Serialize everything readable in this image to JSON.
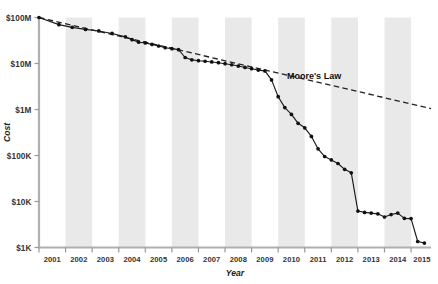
{
  "chart_data": {
    "type": "line",
    "title": "",
    "xlabel": "Year",
    "ylabel": "Cost",
    "yscale": "log",
    "ylim": [
      1000,
      100000000
    ],
    "xlim": [
      2001.0,
      2015.75
    ],
    "grid": false,
    "legend_position": "inline-annotation",
    "ytick_labels": [
      "$100M",
      "$10M",
      "$1M",
      "$100K",
      "$10K",
      "$1K"
    ],
    "ytick_values": [
      100000000,
      10000000,
      1000000,
      100000,
      10000,
      1000
    ],
    "xtick_labels": [
      "2001",
      "2002",
      "2003",
      "2004",
      "2005",
      "2006",
      "2007",
      "2008",
      "2009",
      "2010",
      "2011",
      "2012",
      "2013",
      "2014",
      "2015"
    ],
    "xtick_values": [
      2001,
      2002,
      2003,
      2004,
      2005,
      2006,
      2007,
      2008,
      2009,
      2010,
      2011,
      2012,
      2013,
      2014,
      2015
    ],
    "shaded_band_years": [
      2002,
      2004,
      2006,
      2008,
      2010,
      2012,
      2014
    ],
    "annotations": [
      {
        "text": "Moore's Law",
        "x": 2011.35,
        "y": 4600000
      }
    ],
    "series": [
      {
        "name": "Cost per Genome",
        "marker": "circle",
        "x": [
          2001.0,
          2001.75,
          2002.25,
          2002.75,
          2003.25,
          2003.75,
          2004.25,
          2004.5,
          2004.75,
          2005.0,
          2005.25,
          2005.5,
          2005.75,
          2006.0,
          2006.25,
          2006.5,
          2006.75,
          2007.0,
          2007.25,
          2007.5,
          2007.75,
          2008.0,
          2008.25,
          2008.5,
          2008.75,
          2009.0,
          2009.25,
          2009.5,
          2009.75,
          2010.0,
          2010.25,
          2010.5,
          2010.75,
          2011.0,
          2011.25,
          2011.5,
          2011.75,
          2012.0,
          2012.25,
          2012.5,
          2012.75,
          2013.0,
          2013.25,
          2013.5,
          2013.75,
          2014.0,
          2014.25,
          2014.5,
          2014.75,
          2015.0,
          2015.25,
          2015.5
        ],
        "y": [
          100000000,
          70000000,
          61000000,
          55000000,
          51000000,
          45000000,
          38000000,
          33000000,
          29000000,
          28000000,
          26000000,
          24000000,
          22000000,
          21000000,
          20000000,
          13500000,
          12000000,
          11500000,
          11200000,
          10800000,
          10400000,
          9900000,
          9400000,
          8800000,
          8200000,
          7700000,
          7200000,
          6900000,
          4400000,
          1900000,
          1100000,
          780000,
          500000,
          400000,
          260000,
          140000,
          95000,
          80000,
          67000,
          50000,
          42000,
          33000,
          29000,
          22000,
          16000,
          13000,
          9800,
          8600,
          8200,
          7800,
          7700,
          7500
        ],
        "y_tail_x": [
          2013.0,
          2013.25,
          2013.5,
          2013.75,
          2014.0,
          2014.25,
          2014.5,
          2014.75,
          2015.0,
          2015.25,
          2015.5
        ],
        "y_tail": [
          6200,
          5800,
          5600,
          5400,
          4600,
          5200,
          5600,
          4300,
          4250,
          1350,
          1250
        ]
      }
    ],
    "reference_line": {
      "name": "Moore's Law",
      "x": [
        2001.0,
        2015.75
      ],
      "y": [
        100000000,
        1050000
      ],
      "style": "dashed"
    }
  },
  "axis_titles": {
    "x": "Year",
    "y": "Cost"
  },
  "colors": {
    "band": "#e9e9e9",
    "series": "#111111",
    "axis": "#b0b0b0",
    "text": "#333333"
  }
}
